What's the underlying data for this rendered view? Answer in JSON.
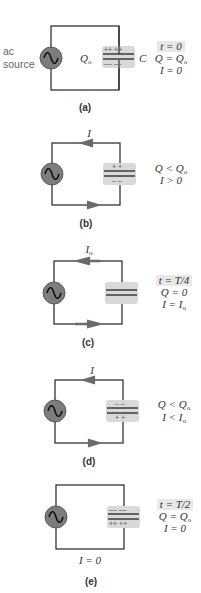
{
  "figure": {
    "panels": [
      {
        "id": "a",
        "label": "(a)",
        "source_label_line1": "ac",
        "source_label_line2": "source",
        "charge_label": "Q",
        "charge_sub": "o",
        "capacitor_label": "C",
        "top_plate_signs": "++ ++",
        "bottom_plate_signs": "–– ––",
        "current_arrow": "none",
        "state": [
          "t = 0",
          "Q = Q",
          "I = 0"
        ],
        "state_subs": [
          "",
          "o",
          ""
        ],
        "time_highlighted": true
      },
      {
        "id": "b",
        "label": "(b)",
        "current_label": "I",
        "current_sub": "",
        "top_plate_signs": "+ +",
        "bottom_plate_signs": "– –",
        "current_arrow": "counterclockwise",
        "state": [
          "Q < Q",
          "I > 0"
        ],
        "state_subs": [
          "o",
          ""
        ],
        "time_highlighted": false
      },
      {
        "id": "c",
        "label": "(c)",
        "current_label": "I",
        "current_sub": "o",
        "top_plate_signs": "",
        "bottom_plate_signs": "",
        "current_arrow": "counterclockwise",
        "state": [
          "t = T/4",
          "Q = 0",
          "I = I"
        ],
        "state_subs": [
          "",
          "",
          "o"
        ],
        "time_highlighted": true
      },
      {
        "id": "d",
        "label": "(d)",
        "current_label": "I",
        "current_sub": "",
        "top_plate_signs": "– –",
        "bottom_plate_signs": "+ +",
        "current_arrow": "counterclockwise",
        "state": [
          "Q < Q",
          "I < I"
        ],
        "state_subs": [
          "o",
          "o"
        ],
        "time_highlighted": false
      },
      {
        "id": "e",
        "label": "(e)",
        "bottom_current_text": "I = 0",
        "top_plate_signs": "–– ––",
        "bottom_plate_signs": "++ ++",
        "current_arrow": "none",
        "state": [
          "t = T/2",
          "Q = Q",
          "I = 0"
        ],
        "state_subs": [
          "",
          "o",
          ""
        ],
        "time_highlighted": true
      }
    ],
    "colors": {
      "wire": "#333333",
      "source_fill": "#7d7d7d",
      "capacitor_highlight": "#d9d9d9",
      "arrow": "#6b6b6b",
      "text": "#333333"
    }
  }
}
